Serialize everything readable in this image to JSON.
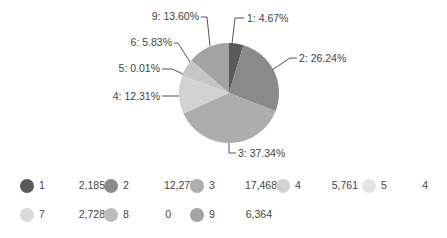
{
  "chart_data": {
    "type": "pie",
    "title": "",
    "categories": [
      "1",
      "2",
      "3",
      "4",
      "5",
      "6",
      "7",
      "8",
      "9"
    ],
    "values": [
      2185,
      12275,
      17468,
      5761,
      4,
      2728,
      2728,
      0,
      6364
    ],
    "percent_labels": [
      "1: 4.67%",
      "2: 26.24%",
      "3: 37.34%",
      "4: 12.31%",
      "5: 0.01%",
      "6: 5.83%",
      "",
      "",
      "9: 13.60%"
    ],
    "percentages": [
      4.67,
      26.24,
      37.34,
      12.31,
      0.01,
      5.83,
      0,
      0,
      13.6
    ],
    "colors": [
      "#5a5a5a",
      "#8a8a8a",
      "#adadad",
      "#d2d2d2",
      "#e4e4e4",
      "#c6c6c6",
      "#dadada",
      "#bdbdbd",
      "#a3a3a3"
    ],
    "legend_position": "bottom"
  },
  "legend": {
    "items": [
      {
        "name": "1",
        "value": "2,185",
        "color": "#5a5a5a"
      },
      {
        "name": "2",
        "value": "12,275",
        "color": "#8a8a8a"
      },
      {
        "name": "3",
        "value": "17,468",
        "color": "#adadad"
      },
      {
        "name": "4",
        "value": "5,761",
        "color": "#d2d2d2"
      },
      {
        "name": "5",
        "value": "4",
        "color": "#e4e4e4"
      },
      {
        "name": "7",
        "value": "2,728",
        "color": "#dadada"
      },
      {
        "name": "8",
        "value": "0",
        "color": "#bdbdbd"
      },
      {
        "name": "9",
        "value": "6,364",
        "color": "#a3a3a3"
      }
    ]
  }
}
